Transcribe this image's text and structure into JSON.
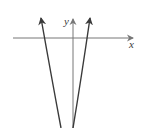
{
  "diagram": {
    "type": "parabola-graph",
    "axes": {
      "x_label": "x",
      "y_label": "y"
    },
    "curve": {
      "description": "Narrow upward-opening parabola with arrows on both branches",
      "color": "#3a3a3a"
    },
    "colors": {
      "axis": "#777777",
      "curve": "#3a3a3a",
      "background": "#ffffff"
    }
  }
}
